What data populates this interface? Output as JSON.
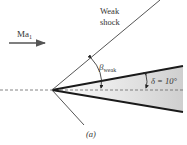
{
  "diagram": {
    "inflow_label": "Ma",
    "inflow_subscript": "1",
    "shock_label_line1": "Weak",
    "shock_label_line2": "shock",
    "beta_symbol": "β",
    "beta_subscript": "weak",
    "delta_label": "δ = 10°",
    "caption": "(a)",
    "colors": {
      "line": "#555555",
      "wedge_edge": "#1a1a1a",
      "wedge_fill_start": "#ffffff",
      "wedge_fill_end": "#cfcfcf",
      "text": "#333333"
    }
  }
}
